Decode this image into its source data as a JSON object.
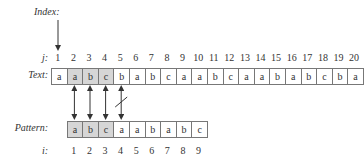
{
  "labels": {
    "index": "Index:",
    "j": "j:",
    "text": "Text:",
    "pattern": "Pattern:",
    "i": "i:"
  },
  "j_indices": [
    "1",
    "2",
    "3",
    "4",
    "5",
    "6",
    "7",
    "8",
    "9",
    "10",
    "11",
    "12",
    "13",
    "14",
    "15",
    "16",
    "17",
    "18",
    "19",
    "20"
  ],
  "text_chars": [
    "a",
    "a",
    "b",
    "c",
    "b",
    "a",
    "b",
    "c",
    "a",
    "a",
    "b",
    "c",
    "a",
    "a",
    "b",
    "a",
    "b",
    "c",
    "b",
    "a"
  ],
  "text_highlighted": [
    2,
    3,
    4
  ],
  "i_indices": [
    "1",
    "2",
    "3",
    "4",
    "5",
    "6",
    "7",
    "8",
    "9"
  ],
  "pattern_chars": [
    "a",
    "b",
    "c",
    "a",
    "a",
    "b",
    "a",
    "b",
    "c"
  ],
  "pattern_highlighted": [
    1,
    2,
    3
  ],
  "index_arrow_points_to_j": 1,
  "comparisons": [
    {
      "text_j": 2,
      "pattern_i": 1,
      "match": true
    },
    {
      "text_j": 3,
      "pattern_i": 2,
      "match": true
    },
    {
      "text_j": 4,
      "pattern_i": 3,
      "match": true
    },
    {
      "text_j": 5,
      "pattern_i": 4,
      "match": false
    }
  ],
  "colors": {
    "highlight": "#d6d6d6",
    "border": "#777777",
    "text": "#333333"
  }
}
